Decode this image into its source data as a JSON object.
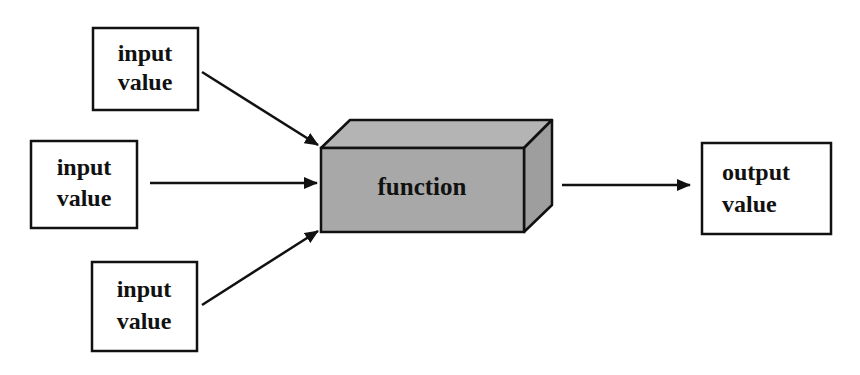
{
  "diagram": {
    "type": "flow",
    "colors": {
      "stroke": "#111111",
      "box_fill": "#ffffff",
      "function_front": "#a8a8a8",
      "function_top": "#b4b4b4",
      "function_side": "#9e9e9e",
      "background": "#ffffff"
    },
    "inputs": [
      {
        "line1": "input",
        "line2": "value"
      },
      {
        "line1": "input",
        "line2": "value"
      },
      {
        "line1": "input",
        "line2": "value"
      }
    ],
    "function": {
      "label": "function"
    },
    "output": {
      "line1": "output",
      "line2": "value"
    },
    "edges": [
      {
        "from": "input-1",
        "to": "function"
      },
      {
        "from": "input-2",
        "to": "function"
      },
      {
        "from": "input-3",
        "to": "function"
      },
      {
        "from": "function",
        "to": "output"
      }
    ]
  }
}
